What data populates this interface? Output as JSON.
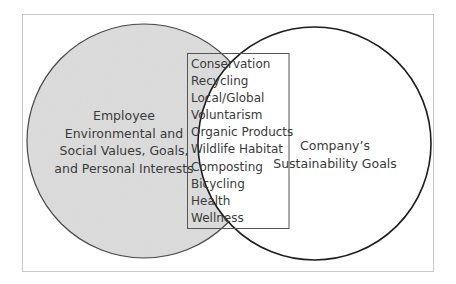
{
  "diagram": {
    "type": "venn",
    "left_circle": {
      "label_lines": [
        "Employee",
        "Environmental and",
        "Social Values, Goals,",
        "and Personal Interests"
      ],
      "fill": "#dcdcdc",
      "stroke": "#404040"
    },
    "right_circle": {
      "label_lines": [
        "Company’s",
        "Sustainability Goals"
      ],
      "fill": "#ffffff",
      "stroke": "#1e1e1e"
    },
    "overlap": {
      "items": [
        "Conservation",
        "Recycling",
        "Local/Global",
        "Voluntarism",
        "Organic Products",
        "Wildlife Habitat",
        "Composting",
        "Bicycling",
        "Health",
        "Wellness"
      ],
      "box_stroke": "#555555"
    },
    "frame_stroke": "#c9c9c9"
  }
}
